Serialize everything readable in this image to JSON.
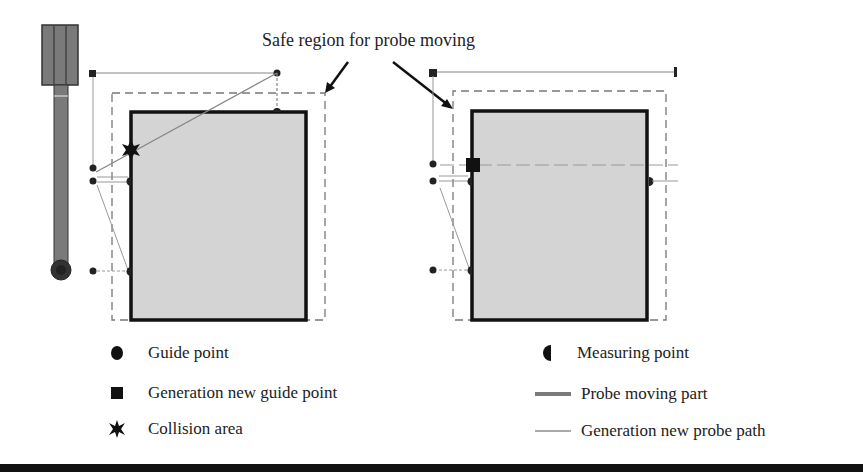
{
  "figure": {
    "annotation": "Safe region for probe moving",
    "colors": {
      "workpiece_fill": "#d4d4d4",
      "workpiece_border": "#111111",
      "probe_body": "#7a7a7a",
      "safe_region_line": "#777777",
      "path_line": "#8a8a8a",
      "rule": "#111111"
    },
    "panels": [
      {
        "name": "before",
        "description": "Original probe path with collision"
      },
      {
        "name": "after",
        "description": "Regenerated probe path avoiding collision"
      }
    ]
  },
  "legend": {
    "left": [
      {
        "icon": "circle-icon",
        "label": "Guide point"
      },
      {
        "icon": "square-icon",
        "label": "Generation new guide point"
      },
      {
        "icon": "asterisk-icon",
        "label": "Collision area"
      }
    ],
    "right": [
      {
        "icon": "half-circle-icon",
        "label": "Measuring point"
      },
      {
        "icon": "thick-line-icon",
        "label": "Probe moving part"
      },
      {
        "icon": "thin-line-icon",
        "label": "Generation new probe path"
      }
    ]
  }
}
